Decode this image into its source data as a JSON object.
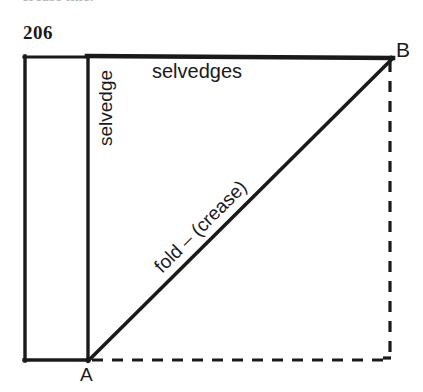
{
  "page": {
    "number": "206",
    "cropped_header_text": "crease line."
  },
  "figure": {
    "title": "",
    "labels": {
      "top_edge": "selvedges",
      "left_edge": "selvedge",
      "diagonal": "fold – (crease)",
      "point_a": "A",
      "point_b": "B"
    },
    "colors": {
      "ink": "#1a1a1a",
      "paper": "#ffffff"
    },
    "geometry": {
      "rect_left_x": 24,
      "rect_top_y": 56,
      "rect_bottom_y": 361,
      "selvedge_divider_x": 88,
      "top_edge_right_x": 392,
      "point_a": [
        88,
        361
      ],
      "point_b": [
        392,
        58
      ],
      "dashed_vertical_x": 390,
      "dashed_bottom_y": 361
    },
    "line_styles": {
      "solid": "solid",
      "dashed": "dashed"
    }
  }
}
